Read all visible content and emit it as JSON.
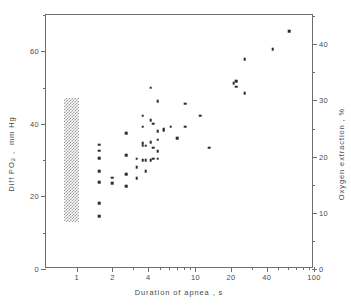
{
  "chart_data": {
    "type": "scatter",
    "title": "",
    "xlabel": "Duration of apnea , s",
    "ylabel": "Diff PO₂ ,  mm Hg",
    "y2label": "Oxygen extraction , %",
    "xscale": "log",
    "xlim": [
      0.55,
      100
    ],
    "ylim": [
      0,
      70
    ],
    "y2lim": [
      0,
      45.2
    ],
    "grid": false,
    "legend": null,
    "xticks_major": [
      1,
      2,
      4,
      10,
      20,
      40,
      100
    ],
    "xticklabels": [
      "1",
      "2",
      "4",
      "10",
      "20",
      "40",
      "100"
    ],
    "xticks_minor": [
      3,
      5,
      6,
      7,
      8,
      9,
      30,
      50,
      60,
      70,
      80,
      90
    ],
    "yticks_major": [
      0,
      20,
      40,
      60
    ],
    "yticklabels": [
      "0",
      "20",
      "40",
      "60"
    ],
    "yticks_minor": [
      10,
      30,
      50,
      70
    ],
    "y2ticks_major": [
      0,
      10,
      20,
      30,
      40
    ],
    "y2ticklabels": [
      "0",
      "10",
      "20",
      "30",
      "40"
    ],
    "y2ticks_minor": [
      5,
      15,
      25,
      35,
      45
    ],
    "marker": "square",
    "marker_color": "#2b2b2b",
    "frame_color": "#6e6e6e",
    "shaded_band": {
      "label": "control-range-band",
      "x_start": 0.78,
      "x_end": 1.05,
      "y_start": 13.0,
      "y_end": 47.0,
      "pattern": "stipple",
      "color": "#8d8d8d"
    },
    "points": [
      [
        1.55,
        34.2
      ],
      [
        1.55,
        32.6
      ],
      [
        1.55,
        30.6
      ],
      [
        1.55,
        27.0
      ],
      [
        1.55,
        24.0
      ],
      [
        1.55,
        18.2
      ],
      [
        1.55,
        14.5
      ],
      [
        2.0,
        25.2
      ],
      [
        2.0,
        23.6
      ],
      [
        2.6,
        37.4
      ],
      [
        2.6,
        31.4
      ],
      [
        2.6,
        26.2
      ],
      [
        2.6,
        22.8
      ],
      [
        3.2,
        30.4
      ],
      [
        3.2,
        28.0
      ],
      [
        3.2,
        25.0
      ],
      [
        3.6,
        42.2
      ],
      [
        3.6,
        39.2
      ],
      [
        3.6,
        34.6
      ],
      [
        3.6,
        34.0
      ],
      [
        3.6,
        30.0
      ],
      [
        3.8,
        34.0
      ],
      [
        3.8,
        30.0
      ],
      [
        3.8,
        27.0
      ],
      [
        4.2,
        50.0
      ],
      [
        4.2,
        41.0
      ],
      [
        4.2,
        35.0
      ],
      [
        4.2,
        30.0
      ],
      [
        4.4,
        40.0
      ],
      [
        4.4,
        33.4
      ],
      [
        4.4,
        30.4
      ],
      [
        4.8,
        46.2
      ],
      [
        4.8,
        38.0
      ],
      [
        4.8,
        35.6
      ],
      [
        4.8,
        32.4
      ],
      [
        4.8,
        30.4
      ],
      [
        5.4,
        38.6
      ],
      [
        5.4,
        38.2
      ],
      [
        6.2,
        39.2
      ],
      [
        7.0,
        36.0
      ],
      [
        8.2,
        45.6
      ],
      [
        8.2,
        39.2
      ],
      [
        11.0,
        42.2
      ],
      [
        13.0,
        33.4
      ],
      [
        21.0,
        51.2
      ],
      [
        22.0,
        51.8
      ],
      [
        22.0,
        50.2
      ],
      [
        26.0,
        57.8
      ],
      [
        26.0,
        48.4
      ],
      [
        45.0,
        60.6
      ],
      [
        62.0,
        65.6
      ]
    ],
    "n_points": 51
  }
}
